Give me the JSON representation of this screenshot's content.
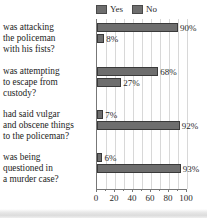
{
  "chart_data": {
    "type": "bar",
    "orientation": "horizontal",
    "title": "",
    "xlabel": "",
    "ylabel": "",
    "xlim": [
      0,
      100
    ],
    "xticks": [
      0,
      20,
      40,
      60,
      80,
      100
    ],
    "xtick_labels": [
      "0",
      "20",
      "40",
      "60",
      "80",
      "100"
    ],
    "minor_gridlines_every": 10,
    "grid": true,
    "legend_position": "top",
    "value_suffix": "%",
    "categories": [
      "was attacking the policeman with his fists?",
      "was attempting to escape from custody?",
      "had said vulgar and obscene things to the policeman?",
      "was being questioned in a murder case?"
    ],
    "category_lines": [
      [
        "was attacking",
        "the policeman",
        "with his fists?"
      ],
      [
        "was attempting",
        "to escape from",
        "custody?"
      ],
      [
        "had said vulgar",
        "and obscene things",
        "to the policeman?"
      ],
      [
        "was being",
        "questioned in",
        "a murder case?"
      ]
    ],
    "series": [
      {
        "name": "Yes",
        "color": "#6e6e6e",
        "values": [
          90,
          8,
          7,
          6
        ],
        "labels": [
          "90%",
          "8%",
          "7%",
          "6%"
        ]
      },
      {
        "name": "No",
        "color": "#6e6e6e",
        "values": [
          8,
          27,
          92,
          93
        ],
        "labels": [
          "8%",
          "27%",
          "92%",
          "93%"
        ]
      }
    ],
    "groups": [
      {
        "bars": [
          {
            "series": "Yes",
            "value": 90,
            "label": "90%"
          },
          {
            "series": "No",
            "value": 8,
            "label": "8%"
          }
        ]
      },
      {
        "bars": [
          {
            "series": "Yes",
            "value": 68,
            "label": "68%"
          },
          {
            "series": "No",
            "value": 27,
            "label": "27%"
          }
        ]
      },
      {
        "bars": [
          {
            "series": "Yes",
            "value": 7,
            "label": "7%"
          },
          {
            "series": "No",
            "value": 92,
            "label": "92%"
          }
        ]
      },
      {
        "bars": [
          {
            "series": "Yes",
            "value": 6,
            "label": "6%"
          },
          {
            "series": "No",
            "value": 93,
            "label": "93%"
          }
        ]
      }
    ]
  },
  "legend": {
    "items": [
      {
        "label": "Yes",
        "color": "#6e6e6e"
      },
      {
        "label": "No",
        "color": "#6e6e6e"
      }
    ]
  },
  "colors": {
    "bar_fill": "#6e6e6e",
    "bar_stroke": "#3a3a3a",
    "gridline": "#d8d8d8",
    "axis": "#777777",
    "text": "#1c1c1c",
    "background": "#ffffff"
  }
}
